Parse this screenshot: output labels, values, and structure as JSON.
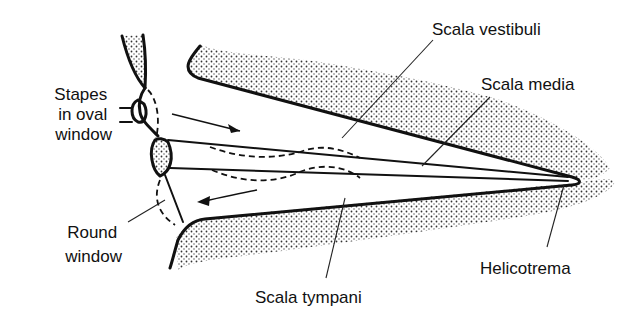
{
  "labels": {
    "stapes": [
      "Stapes",
      "in oval",
      "window"
    ],
    "round_window": [
      "Round",
      "window"
    ],
    "scala_vestibuli": "Scala vestibuli",
    "scala_media": "Scala media",
    "helicotrema": "Helicotrema",
    "scala_tympani": "Scala tympani"
  },
  "colors": {
    "ink": "#111111",
    "background": "#ffffff",
    "stipple": "#333333"
  },
  "arrows": [
    {
      "direction": "inward",
      "region": "scala vestibuli"
    },
    {
      "direction": "outward",
      "region": "scala tympani"
    }
  ]
}
